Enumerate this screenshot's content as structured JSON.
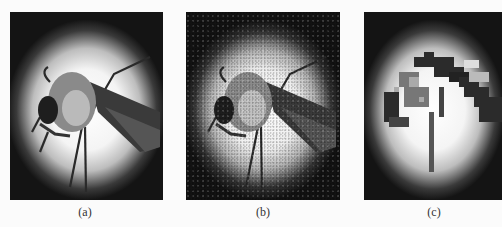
{
  "figure": {
    "panels": [
      {
        "id": "a",
        "label": "(a)",
        "description": "mosquito photograph, original"
      },
      {
        "id": "b",
        "label": "(b)",
        "description": "mosquito photograph with added noise"
      },
      {
        "id": "c",
        "label": "(c)",
        "description": "mosquito photograph, pixelated / low resolution"
      }
    ]
  },
  "colors": {
    "background": "#fbfbfb",
    "panel_dark": "#161616",
    "highlight": "#ffffff"
  }
}
